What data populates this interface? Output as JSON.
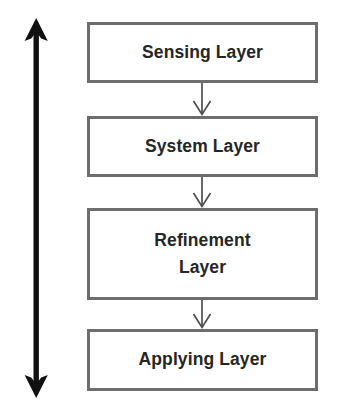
{
  "diagram": {
    "background_color": "#ffffff",
    "box_border_color": "#6d6d6d",
    "text_color": "#262626",
    "arrow_color": "#111111",
    "connector_color": "#555555",
    "direction_arrow": {
      "name": "vertical-double-headed-arrow",
      "orientation": "vertical",
      "heads": "both",
      "label": ""
    },
    "layers": [
      {
        "id": "sensing",
        "label": "Sensing Layer"
      },
      {
        "id": "system",
        "label": "System Layer"
      },
      {
        "id": "refinement",
        "label": "Refinement\nLayer"
      },
      {
        "id": "applying",
        "label": "Applying Layer"
      }
    ],
    "connectors": [
      {
        "from": "sensing",
        "to": "system",
        "style": "arrow-down"
      },
      {
        "from": "system",
        "to": "refinement",
        "style": "arrow-down"
      },
      {
        "from": "refinement",
        "to": "applying",
        "style": "arrow-down"
      }
    ]
  }
}
